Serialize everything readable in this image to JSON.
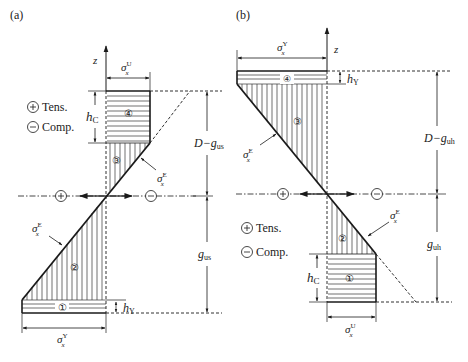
{
  "panels": {
    "a": {
      "label": "(a)",
      "axis_label": "z",
      "legend": {
        "tension": "Tens.",
        "compression": "Comp.",
        "plus_symbol": "+",
        "minus_symbol": "−"
      },
      "top_width_label": {
        "sym": "σ",
        "sup": "U",
        "sub": "x"
      },
      "bottom_width_label": {
        "sym": "σ",
        "sup": "Y",
        "sub": "x"
      },
      "elastic_label": {
        "sym": "σ",
        "sup": "E",
        "sub": "x"
      },
      "hc_label": {
        "sym": "h",
        "sub": "C"
      },
      "hy_label": {
        "sym": "h",
        "sub": "Y"
      },
      "dim_upper": {
        "text": "D−g",
        "sub": "us"
      },
      "dim_lower": {
        "text": "g",
        "sub": "us"
      },
      "regions": [
        "①",
        "②",
        "③",
        "④"
      ]
    },
    "b": {
      "label": "(b)",
      "axis_label": "z",
      "legend": {
        "tension": "Tens.",
        "compression": "Comp.",
        "plus_symbol": "+",
        "minus_symbol": "−"
      },
      "top_width_label": {
        "sym": "σ",
        "sup": "Y",
        "sub": "x"
      },
      "bottom_width_label": {
        "sym": "σ",
        "sup": "U",
        "sub": "x"
      },
      "elastic_label": {
        "sym": "σ",
        "sup": "E",
        "sub": "x"
      },
      "hc_label": {
        "sym": "h",
        "sub": "C"
      },
      "hy_label": {
        "sym": "h",
        "sub": "Y"
      },
      "dim_upper": {
        "text": "D−g",
        "sub": "uh"
      },
      "dim_lower": {
        "text": "g",
        "sub": "uh"
      },
      "regions": [
        "①",
        "②",
        "③",
        "④"
      ]
    }
  },
  "colors": {
    "line": "#1a1a1a",
    "hatch": "#333333",
    "background": "#ffffff"
  }
}
